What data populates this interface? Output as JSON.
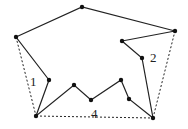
{
  "diagram": {
    "type": "polygon-with-convex-hull",
    "vertices": [
      [
        16,
        37
      ],
      [
        82,
        7
      ],
      [
        175,
        31
      ],
      [
        122,
        41
      ],
      [
        142,
        58
      ],
      [
        153,
        118
      ],
      [
        129,
        99
      ],
      [
        121,
        80
      ],
      [
        91,
        100
      ],
      [
        74,
        85
      ],
      [
        36,
        116
      ],
      [
        49,
        80
      ]
    ],
    "hull_edges": [
      [
        [
          16,
          37
        ],
        [
          36,
          116
        ]
      ],
      [
        [
          36,
          116
        ],
        [
          153,
          118
        ]
      ],
      [
        [
          153,
          118
        ],
        [
          175,
          31
        ]
      ]
    ],
    "labels": [
      {
        "text": "1",
        "x": 30,
        "y": 75
      },
      {
        "text": "2",
        "x": 150,
        "y": 51
      },
      {
        "text": "4",
        "x": 91,
        "y": 107
      }
    ],
    "colors": {
      "line": "#222222",
      "point": "#111111"
    }
  }
}
